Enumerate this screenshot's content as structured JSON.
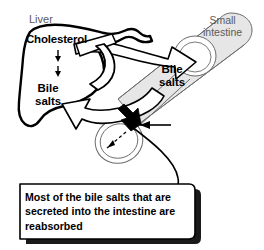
{
  "figure": {
    "type": "biological-process-diagram",
    "background_color": "#ffffff"
  },
  "labels": {
    "liver": "Liver",
    "small_intestine": "Small\nintestine",
    "cholesterol": "Cholesterol",
    "bile_salts_liver": "Bile\nsalts",
    "bile_salts_intestine": "Bile\nsalts"
  },
  "callout": {
    "text": "Most of the bile salts that are secreted into the intestine are reabsorbed",
    "border_color": "#000000",
    "fill_color": "#ffffff",
    "shadow_color": "#1a1a1a"
  },
  "organs": [
    {
      "name": "liver",
      "label": "Liver",
      "fill": "#ffffff",
      "stroke": "#000000",
      "stroke_width": 2.4
    },
    {
      "name": "small-intestine",
      "label": "Small intestine",
      "fill": "#e6e6e6",
      "stroke": "#6b6b6b",
      "stroke_width": 1.0
    },
    {
      "name": "gallbladder",
      "label": "",
      "fill": "#ffffff",
      "stroke": "#6b6b6b",
      "stroke_width": 1.0
    }
  ],
  "arrows": [
    {
      "name": "cholesterol-to-bile-salts",
      "style": "thin-solid-down",
      "from": "Cholesterol",
      "to": "Bile salts",
      "color": "#000000"
    },
    {
      "name": "liver-to-intestine-secretion",
      "style": "large-hollow-white",
      "from": "Liver",
      "to": "Small intestine",
      "color": "#000000"
    },
    {
      "name": "intestine-to-liver-reabsorption",
      "style": "large-hollow-white",
      "from": "Small intestine",
      "to": "Liver",
      "color": "#000000"
    },
    {
      "name": "intestine-reabsorption-solid",
      "style": "solid-black",
      "from": "Intestine",
      "to": "Portal duct",
      "color": "#000000"
    },
    {
      "name": "gallbladder-dashed",
      "style": "dashed",
      "from": "Duct",
      "to": "Gallbladder",
      "color": "#000000"
    },
    {
      "name": "callout-pointer",
      "style": "leader-line",
      "from": "Callout box",
      "to": "Reabsorption site",
      "color": "#000000"
    }
  ],
  "colors": {
    "ink": "#000000",
    "gray_ink": "#5a5a5a",
    "organ_gray": "#e6e6e6",
    "thin_stroke": "#6b6b6b",
    "background": "#ffffff"
  }
}
